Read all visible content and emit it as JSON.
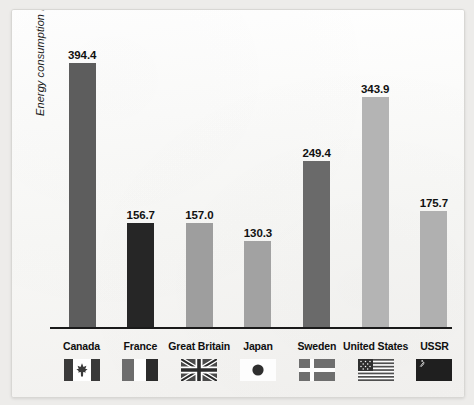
{
  "chart_data": {
    "type": "bar",
    "title": "",
    "xlabel": "",
    "ylabel": "Energy consumption in Btu",
    "categories": [
      "Canada",
      "France",
      "Great Britain",
      "Japan",
      "Sweden",
      "United States",
      "USSR"
    ],
    "values": [
      394.4,
      156.7,
      157.0,
      130.3,
      249.4,
      343.9,
      175.7
    ],
    "value_labels": [
      "394.4",
      "156.7",
      "157.0",
      "130.3",
      "249.4",
      "343.9",
      "175.7"
    ],
    "bar_colors": [
      "#5d5d5d",
      "#262626",
      "#9e9e9e",
      "#a2a2a2",
      "#6a6a6a",
      "#b4b4b4",
      "#b0b0b0"
    ],
    "ylim": [
      0,
      420
    ],
    "grid": false,
    "legend": "none",
    "axis_color": "#1a1a1a"
  },
  "legend": {
    "items": [
      {
        "label": "Canada",
        "flag": "flag-canada"
      },
      {
        "label": "France",
        "flag": "flag-france"
      },
      {
        "label": "Great Britain",
        "flag": "flag-great-britain"
      },
      {
        "label": "Japan",
        "flag": "flag-japan"
      },
      {
        "label": "Sweden",
        "flag": "flag-sweden"
      },
      {
        "label": "United States",
        "flag": "flag-united-states"
      },
      {
        "label": "USSR",
        "flag": "flag-ussr"
      }
    ]
  }
}
